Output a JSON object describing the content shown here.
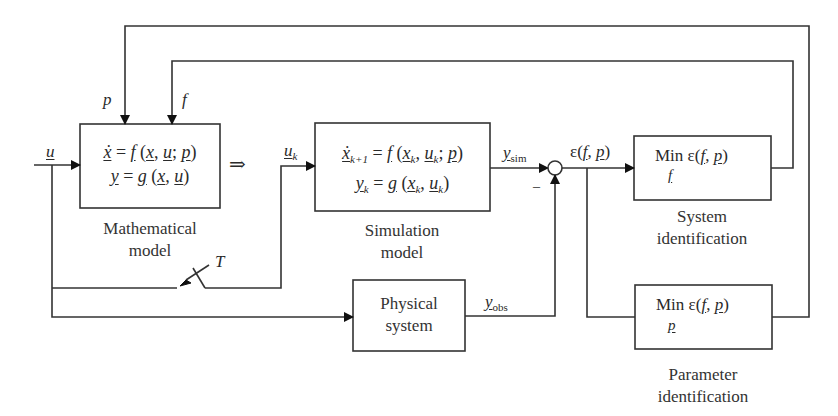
{
  "diagram": {
    "type": "block-diagram",
    "inputs": {
      "u": "u",
      "p": "p",
      "f": "f",
      "T": "T",
      "implies": "⇒"
    },
    "blocks": {
      "mathematical_model": {
        "eq1": "ẋ = f (x, u; p)",
        "eq2": "y = g (x, u)",
        "caption_line1": "Mathematical",
        "caption_line2": "model"
      },
      "simulation_model": {
        "input_label": "u_k",
        "eq1": "ẋ_{k+1} = f (x_k, u_k; p)",
        "eq2": "y_k = g (x_k, u_k)",
        "caption_line1": "Simulation",
        "caption_line2": "model"
      },
      "physical_system": {
        "label_line1": "Physical",
        "label_line2": "system",
        "output_label": "y_obs"
      },
      "system_identification": {
        "text": "Min ε(f, p)",
        "under": "f",
        "caption_line1": "System",
        "caption_line2": "identification"
      },
      "parameter_identification": {
        "text": "Min ε(f, p)",
        "under": "p",
        "caption_line1": "Parameter",
        "caption_line2": "identification"
      }
    },
    "signals": {
      "y_sim": "y_sim",
      "y_obs": "y_obs",
      "error": "ε(f, p)",
      "minus": "–"
    }
  }
}
